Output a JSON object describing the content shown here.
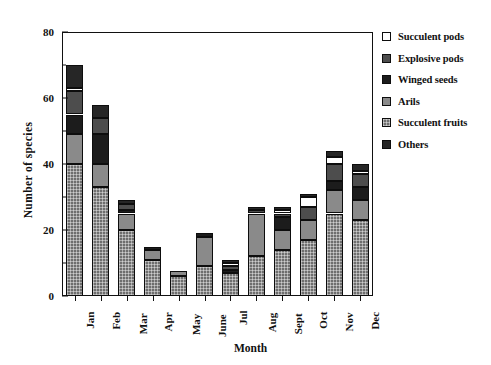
{
  "chart_data": {
    "type": "bar",
    "subtype": "stacked-bar",
    "title": "",
    "xlabel": "Month",
    "ylabel": "Number of species",
    "ylim": [
      0,
      80
    ],
    "yticks": [
      0,
      20,
      40,
      60,
      80
    ],
    "yticks_minor": [
      10,
      30,
      50,
      70
    ],
    "grid": false,
    "legend_position": "right",
    "categories": [
      "Jan",
      "Feb",
      "Mar",
      "Apr",
      "May",
      "June",
      "Jul",
      "Aug",
      "Sept",
      "Oct",
      "Nov",
      "Dec"
    ],
    "series": [
      {
        "name": "Succulent fruits",
        "color": "#6e6e6e",
        "pattern": "fine-checker",
        "values": [
          40,
          33,
          20,
          11,
          6,
          9,
          7,
          12,
          14,
          17,
          25,
          23
        ]
      },
      {
        "name": "Arils",
        "color": "#8a8a8a",
        "pattern": "solid-mid-grey",
        "values": [
          9,
          7,
          5,
          3,
          1.5,
          9,
          0,
          13,
          6,
          6,
          7,
          6
        ]
      },
      {
        "name": "Winged seeds",
        "color": "#1c1c1c",
        "pattern": "solid-near-black",
        "values": [
          6,
          9,
          1,
          1,
          0,
          1,
          1,
          0,
          4,
          0,
          3,
          4
        ]
      },
      {
        "name": "Explosive pods",
        "color": "#4d4d4d",
        "pattern": "solid-dark-grey",
        "values": [
          7,
          5,
          2,
          0,
          0,
          0,
          1,
          1,
          1,
          4,
          5,
          4
        ]
      },
      {
        "name": "Succulent pods",
        "color": "#ffffff",
        "pattern": "white",
        "values": [
          1,
          0,
          0,
          0,
          0,
          0,
          1,
          0,
          1,
          3,
          2,
          1
        ]
      },
      {
        "name": "Others",
        "color": "#262626",
        "pattern": "solid-charcoal",
        "values": [
          7,
          4,
          1,
          0,
          0,
          0,
          1,
          1,
          1,
          1,
          2,
          2
        ]
      }
    ],
    "totals": [
      70,
      58,
      29,
      15,
      7.5,
      19,
      11,
      27,
      27,
      31,
      44,
      40
    ],
    "legend_order": [
      "Succulent pods",
      "Explosive pods",
      "Winged seeds",
      "Arils",
      "Succulent fruits",
      "Others"
    ]
  }
}
